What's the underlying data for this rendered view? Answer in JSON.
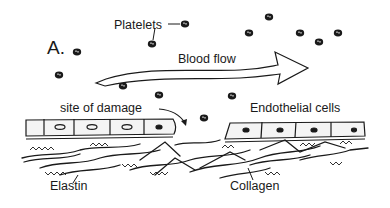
{
  "figure": {
    "panel_label": "A.",
    "labels": {
      "platelets": "Platelets",
      "blood_flow": "Blood flow",
      "site_of_damage": "site of damage",
      "endothelial_cells": "Endothelial cells",
      "elastin": "Elastin",
      "collagen": "Collagen"
    },
    "colors": {
      "ink": "#1a1a1a",
      "background": "#ffffff",
      "cell_fill": "#f4f4f4"
    }
  }
}
